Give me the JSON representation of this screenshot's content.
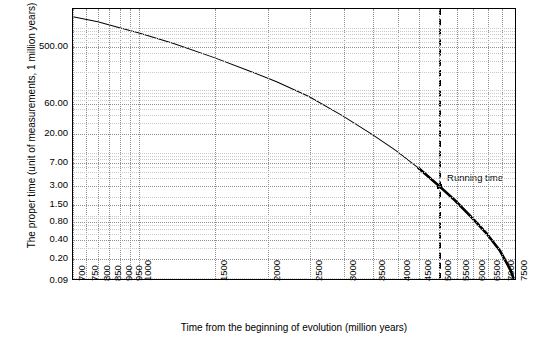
{
  "chart_data": {
    "type": "line",
    "title": "",
    "xlabel": "Time from the beginning of evolution (million years)",
    "ylabel": "The proper time (unit of measurements, 1 million years)",
    "xlim": [
      700,
      7600
    ],
    "ylim_log": [
      0.09,
      2000
    ],
    "xticks": [
      700,
      750,
      800,
      850,
      900,
      950,
      1000,
      1500,
      2000,
      2500,
      3000,
      3500,
      4000,
      4500,
      5000,
      5500,
      6000,
      6500,
      7000,
      7500
    ],
    "xticklabels": [
      "700",
      "750",
      "800",
      "850",
      "900",
      "950",
      "1000",
      "1500",
      "2000",
      "2500",
      "3000",
      "3500",
      "4000",
      "4500",
      "5000",
      "5500",
      "6000",
      "6500",
      "7000",
      "7500"
    ],
    "yticks": [
      0.09,
      0.2,
      0.4,
      0.8,
      1.5,
      3.0,
      7.0,
      20.0,
      60.0,
      500.0
    ],
    "yticklabels": [
      "0.09",
      "0.20",
      "0.40",
      "0.80",
      "1.50",
      "3.00",
      "7.00",
      "20.00",
      "60.00",
      "500.00"
    ],
    "grid": true,
    "log_x": true,
    "log_y": true,
    "series": [
      {
        "name": "proper time",
        "x": [
          700,
          800,
          900,
          1000,
          1200,
          1500,
          1800,
          2100,
          2500,
          3000,
          3500,
          4000,
          4500,
          5000,
          5500,
          6000,
          6500,
          7000,
          7400,
          7550
        ],
        "y": [
          1500,
          1250,
          1000,
          820,
          560,
          330,
          205,
          135,
          78,
          38,
          19.5,
          10.5,
          5.6,
          3.0,
          1.65,
          0.9,
          0.5,
          0.26,
          0.13,
          0.09
        ]
      }
    ],
    "annotations": [
      {
        "label": "Running time",
        "x": 5000,
        "y": 3.0,
        "style": "vertical dashed line with marker"
      }
    ]
  }
}
